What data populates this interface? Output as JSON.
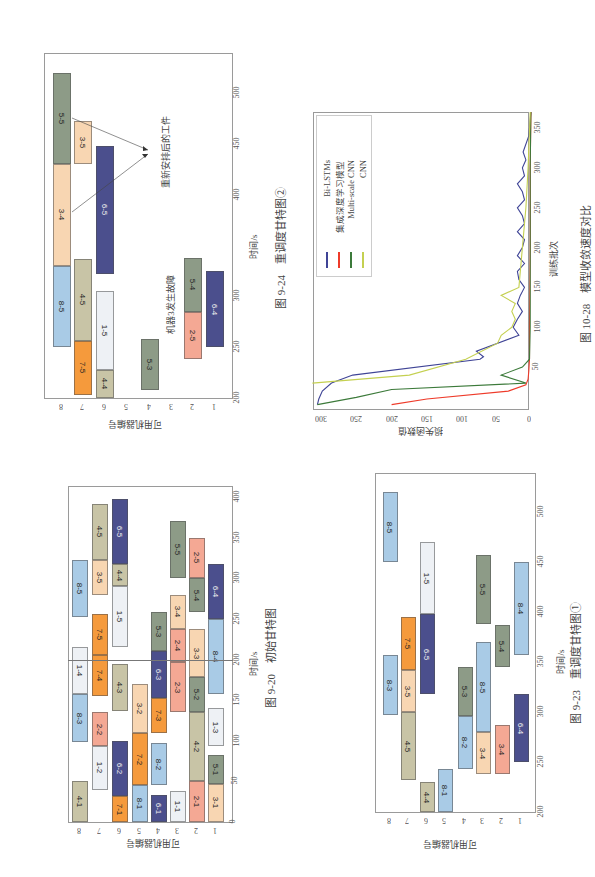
{
  "colors": {
    "navy": "#4b4f8d",
    "salmon": "#f4a894",
    "peach": "#f8d6b2",
    "greygreen": "#8d9b87",
    "lightblue": "#a9cbe6",
    "orange": "#f59a3c",
    "tan": "#c8c4a6",
    "white": "#eef1f5",
    "line_bilstm": "#3f4496",
    "line_ensemble": "#ee3b2a",
    "line_multicnn": "#3c7a3a",
    "line_cnn": "#c4d050"
  },
  "chart_data": [
    {
      "id": "fig9-24",
      "type": "gantt",
      "title": "图 9-24 重调度甘特图②",
      "caption_num": "图 9-24",
      "caption_text": "重调度甘特图②",
      "xlabel": "时间/s",
      "ylabel": "可用机器编号",
      "xticks": [
        200,
        250,
        300,
        400,
        450,
        500
      ],
      "yticks": [
        8,
        7,
        6,
        5,
        4,
        3,
        2,
        1
      ],
      "xlim": [
        200,
        520
      ],
      "annotations": [
        "重新安排后的工件",
        "机器3发生故障"
      ],
      "bars": [
        {
          "machine": 8,
          "label": "8-5",
          "start": 250,
          "end": 330,
          "color": "lightblue"
        },
        {
          "machine": 8,
          "label": "3-4",
          "start": 330,
          "end": 430,
          "color": "peach"
        },
        {
          "machine": 8,
          "label": "5-5",
          "start": 430,
          "end": 520,
          "color": "greygreen"
        },
        {
          "machine": 7,
          "label": "7-5",
          "start": 203,
          "end": 256,
          "color": "orange"
        },
        {
          "machine": 7,
          "label": "4-5",
          "start": 256,
          "end": 337,
          "color": "tan"
        },
        {
          "machine": 7,
          "label": "3-5",
          "start": 430,
          "end": 472,
          "color": "peach"
        },
        {
          "machine": 6,
          "label": "4-4",
          "start": 200,
          "end": 228,
          "color": "tan"
        },
        {
          "machine": 6,
          "label": "1-5",
          "start": 228,
          "end": 305,
          "color": "white"
        },
        {
          "machine": 6,
          "label": "6-5",
          "start": 322,
          "end": 448,
          "color": "navy"
        },
        {
          "machine": 4,
          "label": "5-3",
          "start": 208,
          "end": 258,
          "color": "greygreen"
        },
        {
          "machine": 2,
          "label": "2-5",
          "start": 238,
          "end": 285,
          "color": "salmon"
        },
        {
          "machine": 2,
          "label": "5-4",
          "start": 285,
          "end": 338,
          "color": "greygreen"
        },
        {
          "machine": 1,
          "label": "6-4",
          "start": 250,
          "end": 325,
          "color": "navy"
        }
      ]
    },
    {
      "id": "fig10-28",
      "type": "line",
      "title": "图 10-28 模型收敛速度对比",
      "caption_num": "图 10-28",
      "caption_text": "模型收敛速度对比",
      "xlabel": "训练批次",
      "ylabel": "损失函数值",
      "xticks": [
        50,
        100,
        150,
        200,
        250,
        300,
        350
      ],
      "yticks": [
        0,
        50,
        100,
        150,
        200,
        250,
        300
      ],
      "xlim": [
        0,
        370
      ],
      "ylim": [
        0,
        320
      ],
      "grid": false,
      "legend_position": "upper right",
      "series": [
        {
          "name": "Bi-LSTMs",
          "color": "line_bilstm",
          "x": [
            3,
            10,
            20,
            30,
            40,
            60,
            63,
            70,
            90,
            100,
            110,
            120,
            130,
            140,
            150,
            160,
            170,
            180,
            190,
            200,
            210,
            220,
            230,
            240,
            250,
            260,
            270,
            280,
            290,
            300,
            310,
            320,
            340,
            370
          ],
          "y": [
            305,
            303,
            298,
            285,
            255,
            75,
            70,
            80,
            20,
            28,
            22,
            15,
            22,
            18,
            12,
            20,
            22,
            12,
            22,
            15,
            12,
            22,
            12,
            15,
            22,
            12,
            15,
            22,
            12,
            15,
            10,
            14,
            6,
            3
          ]
        },
        {
          "name": "集成深度学习模型",
          "color": "line_ensemble",
          "x": [
            3,
            10,
            20,
            28,
            35,
            45,
            60,
            100,
            200,
            300,
            370
          ],
          "y": [
            200,
            150,
            35,
            10,
            7,
            6,
            5,
            5,
            4,
            4,
            3
          ]
        },
        {
          "name": "Multi-scale CNN",
          "color": "line_multicnn",
          "x": [
            3,
            12,
            22,
            30,
            40,
            50,
            60,
            100,
            200,
            300,
            370
          ],
          "y": [
            305,
            250,
            200,
            10,
            45,
            15,
            5,
            4,
            4,
            4,
            3
          ]
        },
        {
          "name": "CNN",
          "color": "line_cnn",
          "x": [
            30,
            40,
            60,
            80,
            90,
            100,
            110,
            120,
            130,
            140,
            150,
            170,
            200,
            230,
            250,
            300,
            370
          ],
          "y": [
            320,
            175,
            95,
            50,
            45,
            30,
            25,
            30,
            25,
            45,
            20,
            18,
            15,
            12,
            10,
            7,
            4
          ]
        }
      ]
    },
    {
      "id": "fig9-20",
      "type": "gantt",
      "title": "图 9-20 初始甘特图",
      "caption_num": "图 9-20",
      "caption_text": "初始甘特图",
      "xlabel": "时间/s",
      "ylabel": "可用机器编号",
      "xticks": [
        0,
        50,
        100,
        150,
        200,
        250,
        300,
        350,
        400
      ],
      "yticks": [
        8,
        7,
        6,
        5,
        4,
        3,
        2,
        1
      ],
      "xlim": [
        0,
        410
      ],
      "marker_line": 200,
      "bars": [
        {
          "machine": 8,
          "label": "4-1",
          "start": 0,
          "end": 50,
          "color": "tan"
        },
        {
          "machine": 8,
          "label": "8-3",
          "start": 98,
          "end": 158,
          "color": "lightblue"
        },
        {
          "machine": 8,
          "label": "1-4",
          "start": 158,
          "end": 215,
          "color": "white"
        },
        {
          "machine": 8,
          "label": "8-5",
          "start": 252,
          "end": 322,
          "color": "lightblue"
        },
        {
          "machine": 7,
          "label": "1-2",
          "start": 40,
          "end": 93,
          "color": "white"
        },
        {
          "machine": 7,
          "label": "2-2",
          "start": 93,
          "end": 135,
          "color": "salmon"
        },
        {
          "machine": 7,
          "label": "7-4",
          "start": 155,
          "end": 205,
          "color": "orange"
        },
        {
          "machine": 7,
          "label": "7-5",
          "start": 205,
          "end": 256,
          "color": "orange"
        },
        {
          "machine": 7,
          "label": "3-5",
          "start": 280,
          "end": 323,
          "color": "peach"
        },
        {
          "machine": 7,
          "label": "4-5",
          "start": 323,
          "end": 392,
          "color": "tan"
        },
        {
          "machine": 6,
          "label": "7-1",
          "start": 0,
          "end": 32,
          "color": "orange"
        },
        {
          "machine": 6,
          "label": "6-2",
          "start": 32,
          "end": 100,
          "color": "navy"
        },
        {
          "machine": 6,
          "label": "4-3",
          "start": 137,
          "end": 195,
          "color": "tan"
        },
        {
          "machine": 6,
          "label": "1-5",
          "start": 215,
          "end": 290,
          "color": "white"
        },
        {
          "machine": 6,
          "label": "4-4",
          "start": 290,
          "end": 318,
          "color": "tan"
        },
        {
          "machine": 6,
          "label": "6-5",
          "start": 318,
          "end": 398,
          "color": "navy"
        },
        {
          "machine": 5,
          "label": "8-1",
          "start": 0,
          "end": 45,
          "color": "lightblue"
        },
        {
          "machine": 5,
          "label": "7-2",
          "start": 45,
          "end": 110,
          "color": "orange"
        },
        {
          "machine": 5,
          "label": "3-2",
          "start": 110,
          "end": 170,
          "color": "peach"
        },
        {
          "machine": 4,
          "label": "6-1",
          "start": 0,
          "end": 33,
          "color": "navy"
        },
        {
          "machine": 4,
          "label": "8-2",
          "start": 45,
          "end": 97,
          "color": "lightblue"
        },
        {
          "machine": 4,
          "label": "7-3",
          "start": 110,
          "end": 153,
          "color": "orange"
        },
        {
          "machine": 4,
          "label": "6-3",
          "start": 153,
          "end": 210,
          "color": "navy"
        },
        {
          "machine": 4,
          "label": "5-3",
          "start": 210,
          "end": 258,
          "color": "greygreen"
        },
        {
          "machine": 3,
          "label": "1-1",
          "start": 0,
          "end": 38,
          "color": "white"
        },
        {
          "machine": 3,
          "label": "2-3",
          "start": 135,
          "end": 197,
          "color": "salmon"
        },
        {
          "machine": 3,
          "label": "2-4",
          "start": 197,
          "end": 238,
          "color": "salmon"
        },
        {
          "machine": 3,
          "label": "3-4",
          "start": 238,
          "end": 280,
          "color": "peach"
        },
        {
          "machine": 3,
          "label": "5-5",
          "start": 300,
          "end": 370,
          "color": "greygreen"
        },
        {
          "machine": 2,
          "label": "2-1",
          "start": 0,
          "end": 50,
          "color": "salmon"
        },
        {
          "machine": 2,
          "label": "4-2",
          "start": 50,
          "end": 135,
          "color": "tan"
        },
        {
          "machine": 2,
          "label": "5-2",
          "start": 135,
          "end": 178,
          "color": "greygreen"
        },
        {
          "machine": 2,
          "label": "3-3",
          "start": 178,
          "end": 238,
          "color": "peach"
        },
        {
          "machine": 2,
          "label": "5-4",
          "start": 258,
          "end": 300,
          "color": "greygreen"
        },
        {
          "machine": 2,
          "label": "2-5",
          "start": 300,
          "end": 350,
          "color": "salmon"
        },
        {
          "machine": 1,
          "label": "3-1",
          "start": 0,
          "end": 47,
          "color": "peach"
        },
        {
          "machine": 1,
          "label": "5-1",
          "start": 47,
          "end": 83,
          "color": "greygreen"
        },
        {
          "machine": 1,
          "label": "1-3",
          "start": 93,
          "end": 140,
          "color": "white"
        },
        {
          "machine": 1,
          "label": "8-4",
          "start": 158,
          "end": 250,
          "color": "lightblue"
        },
        {
          "machine": 1,
          "label": "6-4",
          "start": 250,
          "end": 318,
          "color": "navy"
        }
      ]
    },
    {
      "id": "fig9-23",
      "type": "gantt",
      "title": "图 9-23 重调度甘特图①",
      "caption_num": "图 9-23",
      "caption_text": "重调度甘特图①",
      "xlabel": "时间/s",
      "ylabel": "可用机器编号",
      "xticks": [
        200,
        250,
        300,
        350,
        400,
        450,
        500
      ],
      "yticks": [
        8,
        7,
        6,
        5,
        4,
        3,
        2,
        1
      ],
      "xlim": [
        200,
        530
      ],
      "bars": [
        {
          "machine": 8,
          "label": "8-3",
          "start": 297,
          "end": 357,
          "color": "lightblue"
        },
        {
          "machine": 8,
          "label": "8-5",
          "start": 450,
          "end": 520,
          "color": "lightblue"
        },
        {
          "machine": 7,
          "label": "4-5",
          "start": 232,
          "end": 300,
          "color": "tan"
        },
        {
          "machine": 7,
          "label": "3-5",
          "start": 300,
          "end": 342,
          "color": "peach"
        },
        {
          "machine": 7,
          "label": "7-5",
          "start": 342,
          "end": 395,
          "color": "orange"
        },
        {
          "machine": 6,
          "label": "4-4",
          "start": 200,
          "end": 230,
          "color": "tan"
        },
        {
          "machine": 6,
          "label": "6-5",
          "start": 318,
          "end": 398,
          "color": "navy"
        },
        {
          "machine": 6,
          "label": "1-5",
          "start": 398,
          "end": 470,
          "color": "white"
        },
        {
          "machine": 5,
          "label": "8-1",
          "start": 200,
          "end": 243,
          "color": "lightblue"
        },
        {
          "machine": 4,
          "label": "8-2",
          "start": 243,
          "end": 296,
          "color": "lightblue"
        },
        {
          "machine": 4,
          "label": "5-3",
          "start": 296,
          "end": 345,
          "color": "greygreen"
        },
        {
          "machine": 3,
          "label": "3-4",
          "start": 238,
          "end": 280,
          "color": "peach"
        },
        {
          "machine": 3,
          "label": "8-5",
          "start": 280,
          "end": 370,
          "color": "lightblue"
        },
        {
          "machine": 3,
          "label": "5-5",
          "start": 388,
          "end": 457,
          "color": "greygreen"
        },
        {
          "machine": 2,
          "label": "3-4",
          "start": 238,
          "end": 287,
          "color": "salmon"
        },
        {
          "machine": 2,
          "label": "5-4",
          "start": 345,
          "end": 387,
          "color": "greygreen"
        },
        {
          "machine": 1,
          "label": "6-4",
          "start": 250,
          "end": 318,
          "color": "navy"
        },
        {
          "machine": 1,
          "label": "8-4",
          "start": 357,
          "end": 450,
          "color": "lightblue"
        }
      ]
    }
  ],
  "figures": {
    "f924": {
      "caption": "图 9-24　重调度甘特图②",
      "xlabel": "时间/s",
      "ylabel": "可用机器编号",
      "ann1": "重新安排后的工件",
      "ann2": "机器3发生故障"
    },
    "f1028": {
      "caption": "图 10-28　模型收敛速度对比",
      "xlabel": "训练批次",
      "ylabel": "损失函数值",
      "legend": [
        "Bi-LSTMs",
        "集成深度学习模型",
        "Multi-scale CNN",
        "CNN"
      ]
    },
    "f920": {
      "caption": "图 9-20　初始甘特图",
      "xlabel": "时间/s",
      "ylabel": "可用机器编号"
    },
    "f923": {
      "caption": "图 9-23　重调度甘特图①",
      "xlabel": "时间/s",
      "ylabel": "可用机器编号"
    }
  }
}
